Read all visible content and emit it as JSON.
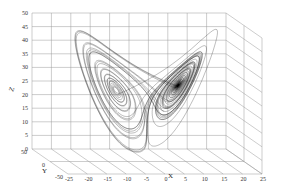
{
  "chart_data": {
    "type": "line3d",
    "title": "",
    "xlabel": "X",
    "ylabel": "Y",
    "zlabel": "Z",
    "x_ticks": [
      "-25",
      "-20",
      "-15",
      "-10",
      "-5",
      "0",
      "5",
      "10",
      "15",
      "20",
      "25"
    ],
    "y_ticks": [
      "-50",
      "0",
      "50"
    ],
    "z_ticks": [
      "0",
      "5",
      "10",
      "15",
      "20",
      "25",
      "30",
      "35",
      "40",
      "45",
      "50"
    ],
    "xlim": [
      -25,
      25
    ],
    "ylim": [
      -50,
      50
    ],
    "zlim": [
      0,
      50
    ],
    "grid": true,
    "series": [
      {
        "name": "Lorenz trajectory",
        "system": "lorenz",
        "params": {
          "sigma": 10,
          "rho": 28,
          "beta": 2.6667
        },
        "initial": [
          1,
          1,
          1
        ],
        "color": "#111111"
      }
    ]
  }
}
